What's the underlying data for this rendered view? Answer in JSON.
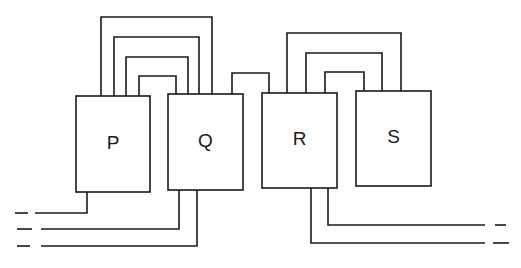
{
  "diagram": {
    "type": "block-interconnection",
    "stroke_color": "#1a1a1a",
    "background": "#ffffff",
    "blocks": [
      {
        "id": "P",
        "label": "P",
        "x": 76,
        "y": 96,
        "w": 74,
        "h": 96
      },
      {
        "id": "Q",
        "label": "Q",
        "x": 168,
        "y": 94,
        "w": 75,
        "h": 96
      },
      {
        "id": "R",
        "label": "R",
        "x": 262,
        "y": 93,
        "w": 75,
        "h": 95
      },
      {
        "id": "S",
        "label": "S",
        "x": 356,
        "y": 91,
        "w": 75,
        "h": 95
      }
    ],
    "connections_top": [
      {
        "name": "pq-loop-1",
        "from": "P",
        "to": "Q",
        "points": "101,96 101,17 212,17 212,94"
      },
      {
        "name": "pq-loop-2",
        "from": "P",
        "to": "Q",
        "points": "114,96 114,37 199,37 199,94"
      },
      {
        "name": "pq-loop-3",
        "from": "P",
        "to": "Q",
        "points": "126,96 126,57 188,57 188,94"
      },
      {
        "name": "pq-loop-4",
        "from": "P",
        "to": "Q",
        "points": "139,96 139,76 176,76 176,94"
      },
      {
        "name": "qr-bridge",
        "from": "Q",
        "to": "R",
        "points": "232,94 232,73 269,73 269,93"
      },
      {
        "name": "rs-loop-1",
        "from": "R",
        "to": "S",
        "points": "287,93 287,33 401,33 401,91"
      },
      {
        "name": "rs-loop-2",
        "from": "R",
        "to": "S",
        "points": "306,93 306,53 382,53 382,91"
      },
      {
        "name": "rs-loop-3",
        "from": "R",
        "to": "S",
        "points": "325,93 325,72 364,72 364,91"
      }
    ],
    "connections_bottom": [
      {
        "name": "p-out-left",
        "from": "P",
        "points": "87,192 87,213 35,213",
        "dash": "15,213 28,213"
      },
      {
        "name": "q-out-left-1",
        "from": "Q",
        "points": "179,190 179,229 41,229",
        "dash": "17,229 32,229"
      },
      {
        "name": "q-out-left-2",
        "from": "Q",
        "points": "197,190 197,246 41,246",
        "dash": "17,246 30,246"
      },
      {
        "name": "r-out-right-1",
        "from": "R",
        "points": "328,188 328,225 485,225",
        "dash": "495,225 506,225"
      },
      {
        "name": "r-out-right-2",
        "from": "R",
        "points": "311,188 311,243 485,243",
        "dash": "493,243 509,243"
      }
    ]
  }
}
